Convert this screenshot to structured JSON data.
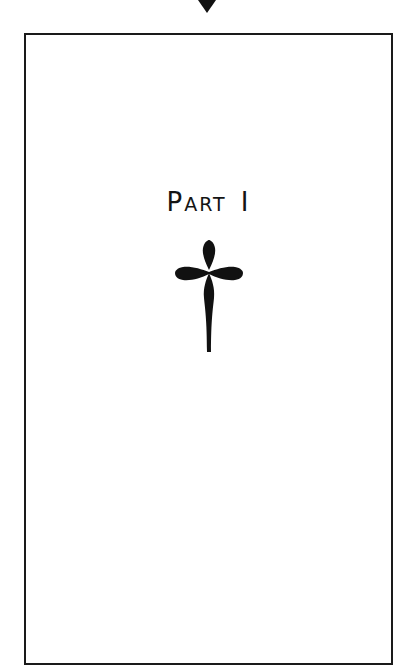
{
  "page": {
    "heading_first_letter": "P",
    "heading_rest": "ART",
    "heading_number": "I",
    "heading_full": "Part I",
    "ornament": "cross-fleuree-icon",
    "marker": "triangle-down-icon"
  },
  "colors": {
    "ink": "#141414",
    "background": "#ffffff",
    "frame": "#1a1a1a"
  }
}
